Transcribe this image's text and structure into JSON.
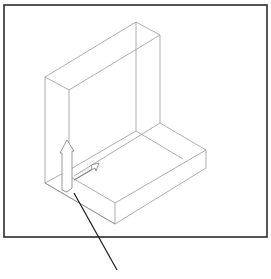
{
  "figure": {
    "type": "isometric-wireframe",
    "colors": {
      "frame": "#2b2b2b",
      "edges": "#8a8a8a",
      "arrows": "#6d6d6d",
      "leader": "#1a1a1a",
      "background": "#ffffff"
    },
    "frame": {
      "x": 4,
      "y": 5,
      "width": 263,
      "height": 232
    },
    "edges": [
      [
        45,
        77,
        136,
        22
      ],
      [
        136,
        22,
        160,
        35
      ],
      [
        160,
        35,
        69,
        90
      ],
      [
        69,
        90,
        45,
        77
      ],
      [
        45,
        77,
        45,
        183
      ],
      [
        69,
        90,
        69,
        190
      ],
      [
        136,
        22,
        136,
        131
      ],
      [
        160,
        35,
        160,
        123
      ],
      [
        160,
        123,
        206,
        150
      ],
      [
        206,
        150,
        206,
        168
      ],
      [
        206,
        168,
        115,
        224
      ],
      [
        115,
        224,
        115,
        203
      ],
      [
        115,
        203,
        206,
        150
      ],
      [
        115,
        203,
        69,
        176
      ],
      [
        45,
        183,
        115,
        224
      ],
      [
        45,
        183,
        69,
        170
      ],
      [
        69,
        170,
        136,
        131
      ],
      [
        136,
        131,
        183,
        159
      ],
      [
        160,
        123,
        74,
        176
      ],
      [
        115,
        224,
        45,
        183
      ]
    ],
    "arrows": {
      "vertical": [
        [
          62,
          190
        ],
        [
          62,
          153
        ],
        [
          60,
          153
        ],
        [
          67,
          140
        ],
        [
          74,
          151
        ],
        [
          72,
          151
        ],
        [
          72,
          188
        ],
        [
          67,
          192
        ]
      ],
      "horizontal": [
        [
          74,
          180
        ],
        [
          92,
          169
        ],
        [
          91,
          165
        ],
        [
          99,
          163
        ],
        [
          96,
          171
        ],
        [
          95,
          168
        ],
        [
          76,
          179
        ]
      ]
    },
    "hidden_lines": [
      [
        67,
        153,
        67,
        188
      ],
      [
        87,
        165,
        95,
        160
      ],
      [
        82,
        172,
        90,
        168
      ]
    ],
    "leader_line": {
      "x1": 74,
      "y1": 193,
      "x2": 117,
      "y2": 270
    }
  }
}
